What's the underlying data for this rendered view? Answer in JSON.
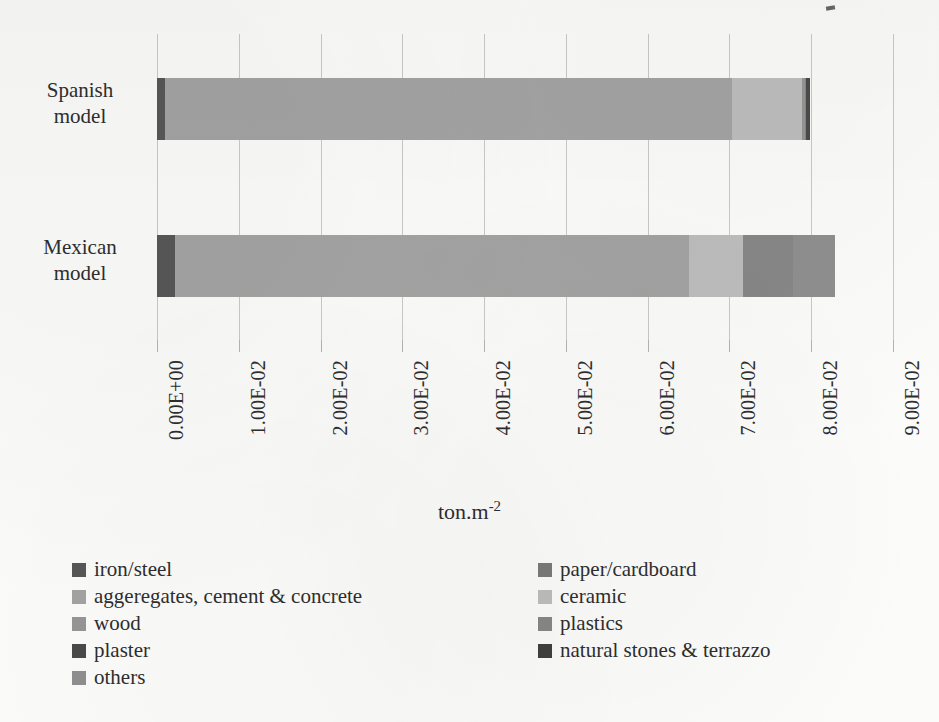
{
  "chart_data": {
    "type": "bar",
    "orientation": "horizontal",
    "stacked": true,
    "title": "",
    "xlabel": "ton.m-2",
    "xlabel_base": "ton.m",
    "xlabel_exponent": "-2",
    "ylabel": "",
    "categories": [
      "Spanish model",
      "Mexican model"
    ],
    "category_lines": [
      [
        "Spanish",
        "model"
      ],
      [
        "Mexican",
        "model"
      ]
    ],
    "xlim": [
      0.0,
      0.09
    ],
    "xticks": [
      0.0,
      0.01,
      0.02,
      0.03,
      0.04,
      0.05,
      0.06,
      0.07,
      0.08,
      0.09
    ],
    "xticklabels": [
      "0.00E+00",
      "1.00E-02",
      "2.00E-02",
      "3.00E-02",
      "4.00E-02",
      "5.00E-02",
      "6.00E-02",
      "7.00E-02",
      "8.00E-02",
      "9.00E-02"
    ],
    "grid": "vertical",
    "legend_position": "bottom",
    "series": [
      {
        "name": "iron/steel",
        "color": "#575757",
        "values": [
          0.001,
          0.0022
        ]
      },
      {
        "name": "paper/cardboard",
        "color": "#7a7a7a",
        "values": [
          0.0,
          0.0
        ]
      },
      {
        "name": "aggeregates, cement & concrete",
        "color": "#a3a3a3",
        "values": [
          0.0693,
          0.0629
        ]
      },
      {
        "name": "ceramic",
        "color": "#bdbdbd",
        "values": [
          0.0086,
          0.0066
        ]
      },
      {
        "name": "wood",
        "color": "#969696",
        "values": [
          0.0003,
          0.0
        ]
      },
      {
        "name": "plastics",
        "color": "#878787",
        "values": [
          0.0002,
          0.0061
        ]
      },
      {
        "name": "plaster",
        "color": "#4a4a4a",
        "values": [
          0.0005,
          0.0
        ]
      },
      {
        "name": "natural stones & terrazzo",
        "color": "#3f3f3f",
        "values": [
          0.0,
          0.0
        ]
      },
      {
        "name": "others",
        "color": "#8f8f8f",
        "values": [
          0.0,
          0.0051
        ]
      }
    ],
    "totals": [
      0.0799,
      0.0829
    ]
  },
  "legend": {
    "left_column": [
      {
        "label": "iron/steel",
        "color": "#575757"
      },
      {
        "label": "aggeregates, cement & concrete",
        "color": "#a3a3a3"
      },
      {
        "label": "wood",
        "color": "#969696"
      },
      {
        "label": "plaster",
        "color": "#4a4a4a"
      },
      {
        "label": "others",
        "color": "#8f8f8f"
      }
    ],
    "right_column": [
      {
        "label": "paper/cardboard",
        "color": "#7a7a7a"
      },
      {
        "label": "ceramic",
        "color": "#bdbdbd"
      },
      {
        "label": "plastics",
        "color": "#878787"
      },
      {
        "label": "natural stones & terrazzo",
        "color": "#3f3f3f"
      }
    ]
  },
  "style": {
    "background": "#fbfbfa",
    "gridline_color": "#c9c9c9",
    "text_color": "#2e2e2e"
  }
}
